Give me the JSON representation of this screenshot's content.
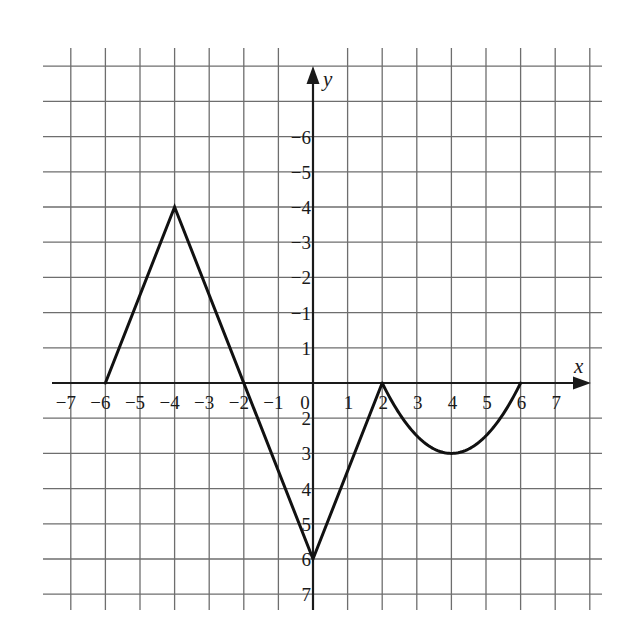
{
  "chart_data": {
    "type": "line",
    "title": "",
    "xlabel": "x",
    "ylabel": "y",
    "xlim": [
      -7,
      7
    ],
    "ylim": [
      -6,
      7
    ],
    "grid": true,
    "x_ticks": [
      -7,
      -6,
      -5,
      -4,
      -3,
      -2,
      -1,
      0,
      1,
      2,
      3,
      4,
      5,
      6,
      7
    ],
    "y_ticks": [
      -6,
      -5,
      -4,
      -3,
      -2,
      -1,
      1,
      2,
      3,
      4,
      5,
      6,
      7
    ],
    "series": [
      {
        "name": "piecewise function",
        "segments": [
          {
            "kind": "linear",
            "points": [
              [
                -6,
                0
              ],
              [
                -4,
                5
              ]
            ]
          },
          {
            "kind": "linear",
            "points": [
              [
                -4,
                5
              ],
              [
                0,
                -5
              ]
            ]
          },
          {
            "kind": "linear",
            "points": [
              [
                0,
                -5
              ],
              [
                2,
                0
              ]
            ]
          },
          {
            "kind": "parabola",
            "points": [
              [
                2,
                0
              ],
              [
                4,
                -2
              ],
              [
                6,
                0
              ]
            ],
            "vertex": [
              4,
              -2
            ]
          }
        ]
      }
    ],
    "key_points": [
      [
        -6,
        0
      ],
      [
        -4,
        5
      ],
      [
        -2,
        0
      ],
      [
        0,
        -5
      ],
      [
        2,
        0
      ],
      [
        4,
        -2
      ],
      [
        6,
        0
      ]
    ]
  },
  "labels": {
    "x_axis": "x",
    "y_axis": "y",
    "origin": "0",
    "x_ticks": [
      "−7",
      "−6",
      "−5",
      "−4",
      "−3",
      "−2",
      "−1",
      "1",
      "2",
      "3",
      "4",
      "5",
      "6",
      "7"
    ],
    "y_ticks": [
      "7",
      "6",
      "5",
      "4",
      "3",
      "2",
      "1",
      "−1",
      "−2",
      "−3",
      "−4",
      "−5",
      "−6"
    ]
  },
  "colors": {
    "grid": "#6e6e6e",
    "axis": "#1a1a1a",
    "curve": "#111111",
    "background": "#ffffff"
  }
}
